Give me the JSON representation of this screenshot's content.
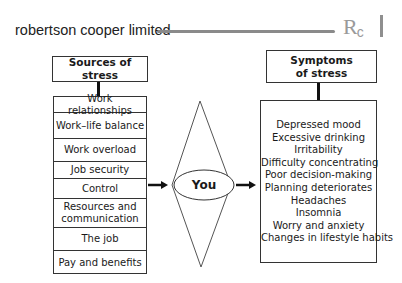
{
  "header": {
    "company_name": "robertson cooper limited",
    "logo_text": "R",
    "logo_sub": "c"
  },
  "sources": {
    "title": "Sources of stress",
    "items": [
      "Work relationships",
      "Work–life balance",
      "Work overload",
      "Job security",
      "Control",
      "Resources and communication",
      "The job",
      "Pay and benefits"
    ]
  },
  "center": {
    "label": "You"
  },
  "symptoms": {
    "title": "Symptoms of stress",
    "items": [
      "Depressed mood",
      "Excessive drinking",
      "Irritability",
      "Difficulty concentrating",
      "Poor decision-making",
      "Planning deteriorates",
      "Headaches",
      "Insomnia",
      "Worry and anxiety",
      "Changes in lifestyle habits"
    ]
  },
  "colors": {
    "line": "#333333",
    "brand_rule": "#8a8a8a",
    "logo": "#9a9a9a"
  }
}
